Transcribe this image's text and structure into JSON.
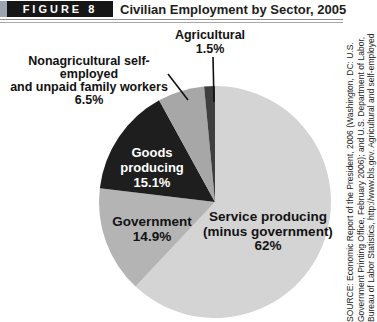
{
  "header": {
    "figure_label": "FIGURE 8",
    "title": "Civilian Employment by Sector, 2005"
  },
  "chart_data": {
    "type": "pie",
    "title": "Civilian Employment by Sector, 2005",
    "unit": "%",
    "direction": "clockwise",
    "start_angle": "12 o'clock",
    "slices": [
      {
        "label": "Service producing (minus government)",
        "value": 62,
        "display": "62%",
        "color": "#d4d4d4",
        "text_color": "#141414"
      },
      {
        "label": "Government",
        "value": 14.9,
        "display": "14.9%",
        "color": "#b4b4b4",
        "text_color": "#141414"
      },
      {
        "label": "Goods producing",
        "value": 15.1,
        "display": "15.1%",
        "color": "#1e1e1e",
        "text_color": "#ffffff"
      },
      {
        "label": "Nonagricultural self-employed and unpaid family workers",
        "value": 6.5,
        "display": "6.5%",
        "color": "#a7a7a7",
        "text_color": "#141414"
      },
      {
        "label": "Agricultural",
        "value": 1.5,
        "display": "1.5%",
        "color": "#3e3e3e",
        "text_color": "#141414"
      }
    ]
  },
  "labels": {
    "agricultural": {
      "line1": "Agricultural",
      "line2": "1.5%"
    },
    "nonagricultural": {
      "line1": "Nonagricultural self-employed",
      "line2": "and unpaid family workers",
      "line3": "6.5%"
    },
    "goods": {
      "line1": "Goods",
      "line2": "producing",
      "line3": "15.1%"
    },
    "government": {
      "line1": "Government",
      "line2": "14.9%"
    },
    "service": {
      "line1": "Service producing",
      "line2": "(minus government)",
      "line3": "62%"
    }
  },
  "source_note": {
    "line1": "SOURCE: Economic Report of the President, 2006 (Washington, DC: U.S.",
    "line2": "Government Printing Office, February 2006); and U.S. Department of Labor,",
    "line3": "Bureau of Labor Statistics, http://www.bls.gov. Agricultural and self-employed"
  },
  "colors": {
    "figure_box_bg": "#161616",
    "figure_box_text": "#ffffff",
    "accent_strip": "#9aa5b0",
    "rule": "#8f8f8f",
    "leader_line": "#111111"
  }
}
